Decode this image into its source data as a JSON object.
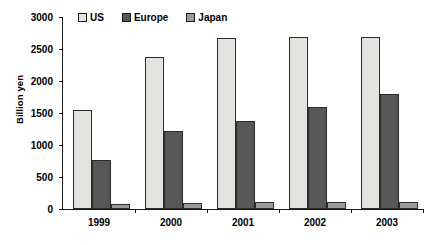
{
  "chart_data": {
    "type": "bar",
    "title": "",
    "xlabel": "",
    "ylabel": "Billion yen",
    "categories": [
      "1999",
      "2000",
      "2001",
      "2002",
      "2003"
    ],
    "series": [
      {
        "name": "US",
        "values": [
          1550,
          2380,
          2670,
          2690,
          2680
        ],
        "color": "#e3e3e0"
      },
      {
        "name": "Europe",
        "values": [
          760,
          1215,
          1375,
          1595,
          1790
        ],
        "color": "#575757"
      },
      {
        "name": "Japan",
        "values": [
          75,
          90,
          105,
          110,
          115
        ],
        "color": "#9a9a98"
      }
    ],
    "ylim": [
      0,
      3000
    ],
    "yticks": [
      0,
      500,
      1000,
      1500,
      2000,
      2500,
      3000
    ],
    "ytick_labels": [
      "0",
      "500",
      "1000",
      "1500",
      "2000",
      "2500",
      "3000"
    ],
    "grid": false,
    "legend_position": "top-left",
    "legend": [
      "US",
      "Europe",
      "Japan"
    ]
  }
}
